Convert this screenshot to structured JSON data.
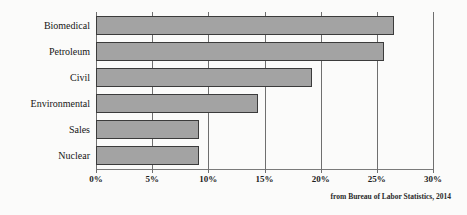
{
  "chart_data": {
    "type": "bar",
    "orientation": "horizontal",
    "title": "",
    "subtitle": "",
    "xlabel": "",
    "ylabel": "",
    "categories": [
      "Biomedical",
      "Petroleum",
      "Civil",
      "Environmental",
      "Sales",
      "Nuclear"
    ],
    "values": [
      26.5,
      25.6,
      19.2,
      14.4,
      9.2,
      9.2
    ],
    "value_unit": "%",
    "xlim": [
      0,
      30
    ],
    "x_ticks": [
      0,
      5,
      10,
      15,
      20,
      25,
      30
    ],
    "x_tick_labels": [
      "0%",
      "5%",
      "10%",
      "15%",
      "20%",
      "25%",
      "30%"
    ],
    "grid": "vertical",
    "legend": "none",
    "annotations": [
      "from Bureau of Labor Statistics, 2014"
    ],
    "series": [
      {
        "name": "Projected growth",
        "values": [
          26.5,
          25.6,
          19.2,
          14.4,
          9.2,
          9.2
        ]
      }
    ]
  },
  "caption": {
    "source_note": "from Bureau of Labor Statistics, 2014"
  },
  "colors": {
    "bar_fill": "#a3a3a3",
    "bar_border": "#3b3b3b",
    "gridline": "#6f6f6f",
    "background": "#fbfbfa",
    "text": "#161616"
  }
}
